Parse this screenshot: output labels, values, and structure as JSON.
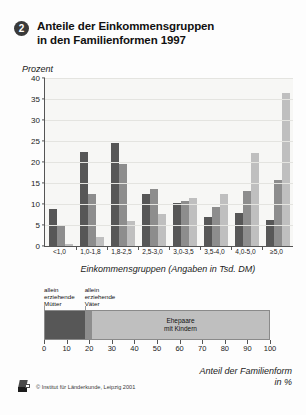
{
  "figure": {
    "number": "2",
    "title_line1": "Anteile der Einkommensgruppen",
    "title_line2": "in den Familienformen 1997"
  },
  "chart_data": {
    "type": "bar",
    "title": "Anteile der Einkommensgruppen in den Familienformen 1997",
    "ylabel": "Prozent",
    "xlabel": "Einkommensgruppen (Angaben in Tsd. DM)",
    "ylim": [
      0,
      40
    ],
    "yticks": [
      0,
      5,
      10,
      15,
      20,
      25,
      30,
      35,
      40
    ],
    "grid": true,
    "legend": "none",
    "categories": [
      "<1,0",
      "1,0-1,8",
      "1,8-2,5",
      "2,5-3,0",
      "3,0-3,5",
      "3,5-4,0",
      "4,0-5,0",
      "≥5,0"
    ],
    "series": [
      {
        "name": "allein erziehende Mütter",
        "color": "#575757",
        "values": [
          8.7,
          22.4,
          24.6,
          12.5,
          10.2,
          6.9,
          7.8,
          6.2
        ]
      },
      {
        "name": "allein erziehende Väter",
        "color": "#8d8d8d",
        "values": [
          4.8,
          12.3,
          19.5,
          13.6,
          10.6,
          9.2,
          13.2,
          15.8
        ]
      },
      {
        "name": "Ehepaare mit Kindern",
        "color": "#bfbfbf",
        "values": [
          0.5,
          2.2,
          5.9,
          7.6,
          11.5,
          12.5,
          22.1,
          36.4
        ]
      }
    ]
  },
  "stacked_chart": {
    "type": "bar",
    "orientation": "horizontal",
    "xlabel_line1": "Anteil der Familienform",
    "xlabel_line2": "in %",
    "xlim": [
      0,
      100
    ],
    "xticks": [
      "0",
      "10",
      "20",
      "30",
      "40",
      "50",
      "60",
      "70",
      "80",
      "90",
      "100"
    ],
    "segments": [
      {
        "name": "allein erziehende Mütter",
        "value": 18.0,
        "color": "#575757",
        "callout": "allein\nerziehende\nMütter",
        "inline_label": ""
      },
      {
        "name": "allein erziehende Väter",
        "value": 3.0,
        "color": "#8d8d8d",
        "callout": "allein\nerziehende\nVäter",
        "inline_label": ""
      },
      {
        "name": "Ehepaare mit Kindern",
        "value": 79.0,
        "color": "#bfbfbf",
        "callout": "",
        "inline_label": "Ehepaare\nmit Kindern"
      }
    ]
  },
  "footer": {
    "credit": "© Institut für Länderkunde, Leipzig 2001",
    "logo_name": "ifl-logo"
  }
}
